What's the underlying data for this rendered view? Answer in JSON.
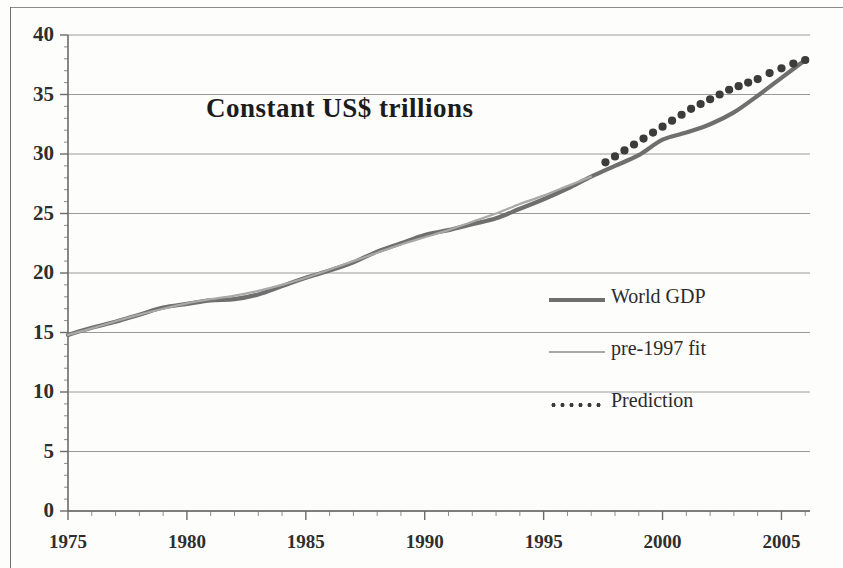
{
  "chart_data": {
    "type": "line",
    "title": "Constant US$ trillions",
    "xlabel": "",
    "ylabel": "",
    "xlim": [
      1975,
      2006.2
    ],
    "ylim": [
      0,
      40
    ],
    "xticks": [
      1975,
      1980,
      1985,
      1990,
      1995,
      2000,
      2005
    ],
    "xtick_labels": [
      "1975",
      "1980",
      "1985",
      "1990",
      "1995",
      "2000",
      "2005"
    ],
    "yticks": [
      0,
      5,
      10,
      15,
      20,
      25,
      30,
      35,
      40
    ],
    "ytick_labels": [
      "0",
      "5",
      "10",
      "15",
      "20",
      "25",
      "30",
      "35",
      "40"
    ],
    "minor_x_interval": 1,
    "minor_y_interval": 1,
    "grid": "horizontal-major",
    "legend_position": "center-right",
    "series": [
      {
        "name": "World GDP",
        "style": "solid-thick",
        "color": "#6f6f6f",
        "x": [
          1975,
          1976,
          1977,
          1978,
          1979,
          1980,
          1981,
          1982,
          1983,
          1984,
          1985,
          1986,
          1987,
          1988,
          1989,
          1990,
          1991,
          1992,
          1993,
          1994,
          1995,
          1996,
          1997,
          1998,
          1999,
          2000,
          2001,
          2002,
          2003,
          2004,
          2005,
          2006
        ],
        "values": [
          14.8,
          15.4,
          15.9,
          16.5,
          17.1,
          17.4,
          17.7,
          17.8,
          18.2,
          18.9,
          19.6,
          20.2,
          20.9,
          21.8,
          22.5,
          23.2,
          23.6,
          24.1,
          24.6,
          25.4,
          26.2,
          27.1,
          28.1,
          29.0,
          29.9,
          31.2,
          31.8,
          32.5,
          33.5,
          34.9,
          36.4,
          37.9
        ]
      },
      {
        "name": "pre-1997 fit",
        "style": "solid-thin",
        "color": "#a9a9a9",
        "x": [
          1975,
          1976,
          1977,
          1978,
          1979,
          1980,
          1981,
          1982,
          1983,
          1984,
          1985,
          1986,
          1987,
          1988,
          1989,
          1990,
          1991,
          1992,
          1993,
          1994,
          1995,
          1996,
          1997
        ],
        "values": [
          14.8,
          15.35,
          15.95,
          16.5,
          17.0,
          17.45,
          17.8,
          18.1,
          18.5,
          19.0,
          19.6,
          20.3,
          21.0,
          21.7,
          22.4,
          23.0,
          23.6,
          24.3,
          25.0,
          25.8,
          26.5,
          27.3,
          28.1
        ]
      },
      {
        "name": "Prediction",
        "style": "dotted",
        "color": "#3c3c3c",
        "x": [
          1997.6,
          1998.0,
          1998.4,
          1998.8,
          1999.2,
          1999.6,
          2000.0,
          2000.4,
          2000.8,
          2001.2,
          2001.6,
          2002.0,
          2002.4,
          2002.8,
          2003.2,
          2003.6,
          2004.0,
          2004.5,
          2005.0,
          2005.5,
          2006.0
        ],
        "values": [
          29.3,
          29.8,
          30.3,
          30.8,
          31.3,
          31.8,
          32.3,
          32.8,
          33.3,
          33.8,
          34.2,
          34.6,
          35.0,
          35.4,
          35.7,
          36.0,
          36.3,
          36.8,
          37.2,
          37.6,
          37.9
        ]
      }
    ]
  },
  "title": {
    "text": "Constant US$ trillions"
  },
  "axes": {
    "y_labels": [
      "40",
      "35",
      "30",
      "25",
      "20",
      "15",
      "10",
      "5",
      "0"
    ],
    "x_labels": [
      "1975",
      "1980",
      "1985",
      "1990",
      "1995",
      "2000",
      "2005"
    ]
  },
  "legend": {
    "items": [
      {
        "label": "World GDP",
        "key": "solid-thick-line-icon"
      },
      {
        "label": "pre-1997 fit",
        "key": "solid-thin-line-icon"
      },
      {
        "label": "Prediction",
        "key": "dotted-line-icon"
      }
    ]
  }
}
